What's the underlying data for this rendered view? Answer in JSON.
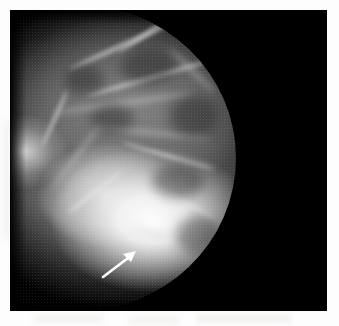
{
  "image": {
    "modality_label": "mammogram",
    "view_label": "mediolateral-oblique",
    "laterality_label": "breast facing left",
    "background_color": "#000000",
    "page_color": "#ffffff",
    "tissue_bright_color": "#f2f2f2",
    "tissue_mid_color": "#6a6a6a",
    "annotation_color": "#ffffff",
    "film": {
      "left": 10,
      "top": 10,
      "width": 317,
      "height": 301
    },
    "chest_wall_edge_x": 236,
    "anterior_margin_x": 66
  },
  "annotations": [
    {
      "name": "arrow",
      "type": "arrow",
      "color": "#ffffff",
      "tail_x": 103,
      "tail_y": 277,
      "tip_x": 135,
      "tip_y": 252,
      "points_to": "inferior breast margin"
    }
  ],
  "overlay_text": [],
  "caption": ""
}
